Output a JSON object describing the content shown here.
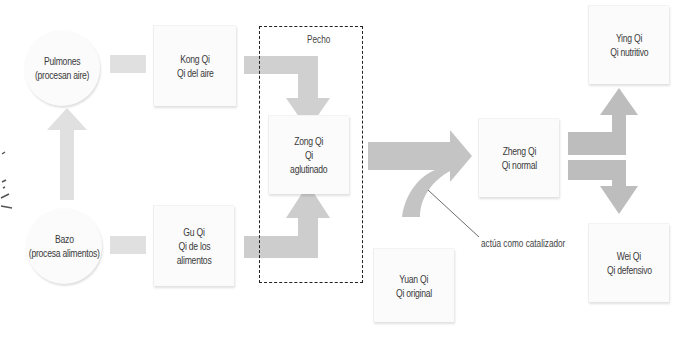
{
  "nodes": {
    "lungs": {
      "line1": "Pulmones",
      "line2": "(procesan aire)"
    },
    "spleen": {
      "line1": "Bazo",
      "line2": "(procesa alimentos)"
    },
    "kong_qi": {
      "line1": "Kong Qi",
      "line2": "Qi del aire"
    },
    "gu_qi": {
      "line1": "Gu Qi",
      "line2": "Qi de los",
      "line3": "alimentos"
    },
    "zong_qi": {
      "line1": "Zong Qi",
      "line2": "Qi",
      "line3": "aglutinado"
    },
    "yuan_qi": {
      "line1": "Yuan Qi",
      "line2": "Qi original"
    },
    "zheng_qi": {
      "line1": "Zheng Qi",
      "line2": "Qi normal"
    },
    "ying_qi": {
      "line1": "Ying Qi",
      "line2": "Qi nutritivo"
    },
    "wei_qi": {
      "line1": "Wei Qi",
      "line2": "Qi defensivo"
    }
  },
  "regions": {
    "chest": "Pecho"
  },
  "annotations": {
    "catalyst": "actúa como catalizador"
  },
  "colors": {
    "arrow": "#c4c4c4",
    "arrow_light": "#dcdcdc",
    "node_bg": "#fbfbfb",
    "dashed": "#222222"
  }
}
